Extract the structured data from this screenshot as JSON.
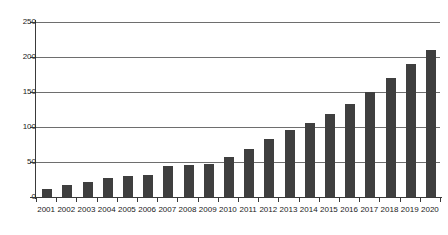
{
  "chart_data": {
    "type": "bar",
    "title": "",
    "subtitle": "",
    "xlabel": "",
    "ylabel": "",
    "categories": [
      "2001",
      "2002",
      "2003",
      "2004",
      "2005",
      "2006",
      "2007",
      "2008",
      "2009",
      "2010",
      "2011",
      "2012",
      "2013",
      "2014",
      "2015",
      "2016",
      "2017",
      "2018",
      "2019",
      "2020"
    ],
    "values": [
      11,
      17,
      22,
      27,
      30,
      32,
      44,
      46,
      47,
      57,
      68,
      83,
      96,
      106,
      118,
      133,
      150,
      170,
      190,
      210
    ],
    "series": [
      {
        "name": "",
        "values": [
          11,
          17,
          22,
          27,
          30,
          32,
          44,
          46,
          47,
          57,
          68,
          83,
          96,
          106,
          118,
          133,
          150,
          170,
          190,
          210
        ]
      }
    ],
    "ylim": [
      0,
      250
    ],
    "yticks": [
      0,
      50,
      100,
      150,
      200,
      250
    ],
    "ytick_labels": [
      "0",
      "50",
      "100",
      "150",
      "200",
      "250"
    ],
    "grid": true,
    "grid_axis": "y",
    "legend": false,
    "legend_position": "none",
    "bar_color": "#3f3f3f",
    "axis_color": "#3a3a3a",
    "grid_color": "#6e6e6e",
    "background_color": "#ffffff",
    "annotations": []
  }
}
